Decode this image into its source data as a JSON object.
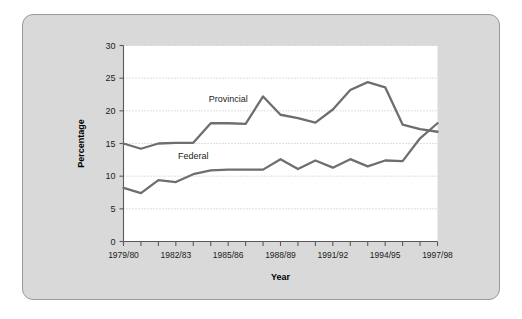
{
  "chart_data": {
    "type": "line",
    "title": "",
    "xlabel": "Year",
    "ylabel": "Percentage",
    "ylim": [
      0,
      30
    ],
    "yticks": [
      0,
      5,
      10,
      15,
      20,
      25,
      30
    ],
    "grid": "horizontal-dotted",
    "legend": "inline-labels",
    "x": [
      "1979/80",
      "1980/81",
      "1981/82",
      "1982/83",
      "1983/84",
      "1984/85",
      "1985/86",
      "1986/87",
      "1987/88",
      "1988/89",
      "1989/90",
      "1990/91",
      "1991/92",
      "1992/93",
      "1993/94",
      "1994/95",
      "1995/96",
      "1996/97",
      "1997/98"
    ],
    "xtick_labels": [
      "1979/80",
      "",
      "",
      "1982/83",
      "",
      "",
      "1985/86",
      "",
      "",
      "1988/89",
      "",
      "",
      "1991/92",
      "",
      "",
      "1994/95",
      "",
      "",
      "1997/98"
    ],
    "series": [
      {
        "name": "Provincial",
        "values": [
          15.0,
          14.2,
          15.0,
          15.1,
          15.1,
          18.1,
          18.1,
          18.0,
          22.2,
          19.4,
          18.9,
          18.2,
          20.2,
          23.2,
          24.4,
          23.6,
          17.9,
          17.2,
          16.8
        ]
      },
      {
        "name": "Federal",
        "values": [
          8.2,
          7.4,
          9.4,
          9.1,
          10.3,
          10.9,
          11.0,
          11.0,
          11.0,
          12.6,
          11.1,
          12.4,
          11.3,
          12.6,
          11.5,
          12.4,
          12.3,
          15.8,
          18.1
        ]
      }
    ],
    "annotations": [
      {
        "text": "Provincial",
        "x_index": 6,
        "y_value": 21.4
      },
      {
        "text": "Federal",
        "x_index": 4,
        "y_value": 12.6
      }
    ],
    "tail_points": {
      "provincial_tail": [
        {
          "x_index": 16,
          "y_value": 17.9
        },
        {
          "x_index": 17,
          "y_value": 17.2
        },
        {
          "x_index": 18,
          "y_value": 17.1
        }
      ],
      "federal_tail": [
        {
          "x_index": 17,
          "y_value": 18.1
        },
        {
          "x_index": 18,
          "y_value": 17.1
        }
      ]
    },
    "colors": {
      "line": "#6e6e6e",
      "panel_background": "#d9d9d9",
      "plot_background": "#ffffff",
      "axis": "#5a5a5a",
      "grid": "#b9b9b9",
      "text": "#1b1b1b"
    }
  }
}
